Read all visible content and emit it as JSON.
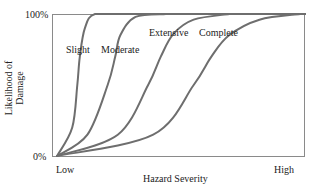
{
  "chart_data": {
    "type": "line",
    "title": "",
    "xlabel": "Hazard Severity",
    "ylabel": "Likelihood of Damage",
    "ylabel_lines": [
      "Likelihood of",
      "Damage"
    ],
    "x_ticks": [
      "Low",
      "High"
    ],
    "y_ticks": [
      "0%",
      "100%"
    ],
    "xlim": [
      0,
      1
    ],
    "ylim": [
      0,
      100
    ],
    "grid": false,
    "legend": "inline labels",
    "line_color": "#6e6e6e",
    "axis_color": "#8a8a8a",
    "series": [
      {
        "name": "Slight",
        "x": [
          0.02,
          0.08,
          0.1,
          0.11,
          0.13,
          0.17,
          0.3
        ],
        "y": [
          0,
          20,
          50,
          70,
          90,
          100,
          100
        ]
      },
      {
        "name": "Moderate",
        "x": [
          0.02,
          0.14,
          0.22,
          0.25,
          0.27,
          0.33,
          0.45
        ],
        "y": [
          0,
          15,
          50,
          70,
          85,
          98,
          100
        ]
      },
      {
        "name": "Extensive",
        "x": [
          0.02,
          0.26,
          0.38,
          0.43,
          0.48,
          0.56,
          0.7
        ],
        "y": [
          0,
          15,
          50,
          70,
          86,
          96,
          100
        ]
      },
      {
        "name": "Complete",
        "x": [
          0.02,
          0.4,
          0.56,
          0.63,
          0.7,
          0.82,
          0.98
        ],
        "y": [
          0,
          15,
          50,
          70,
          85,
          96,
          100
        ]
      }
    ]
  }
}
